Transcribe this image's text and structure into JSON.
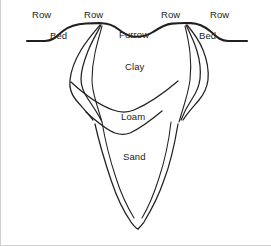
{
  "diagram": {
    "stroke_color": "#231f20",
    "background_color": "#ffffff",
    "border_color": "#cfcfcf",
    "labels": [
      {
        "id": "row-left-outer",
        "text": "Row",
        "x": 31,
        "y": 9
      },
      {
        "id": "row-left-inner",
        "text": "Row",
        "x": 83,
        "y": 9
      },
      {
        "id": "row-right-inner",
        "text": "Row",
        "x": 160,
        "y": 9
      },
      {
        "id": "row-right-outer",
        "text": "Row",
        "x": 209,
        "y": 9
      },
      {
        "id": "bed-left",
        "text": "Bed",
        "x": 49,
        "y": 30
      },
      {
        "id": "furrow",
        "text": "Furrow",
        "x": 118,
        "y": 29
      },
      {
        "id": "bed-right",
        "text": "Bed",
        "x": 198,
        "y": 30
      },
      {
        "id": "layer-clay",
        "text": "Clay",
        "x": 124,
        "y": 61
      },
      {
        "id": "layer-loam",
        "text": "Loam",
        "x": 120,
        "y": 111
      },
      {
        "id": "layer-sand",
        "text": "Sand",
        "x": 122,
        "y": 151
      }
    ],
    "paths": [
      {
        "id": "soil-surface",
        "role": "ground-surface-profile",
        "class": "soil-line",
        "d": "M 26,41 L 44,41 C 52,41 56,36 62,31 C 67,27 74,24 85,23.5 C 92,23.2 97,23.1 101,23.2 C 108,23.5 112,25 117,29 C 122,33 126,36 132,36.6 C 140,37.2 146,36 152,32 C 158,28 163,24.5 171,23.6 C 178,22.9 184,22.9 190,23.1 C 198,23.4 203,26 209,31 C 215,36 219,41 227,41 L 246,41"
      },
      {
        "id": "wetting-front-left-outer",
        "role": "wetting-front-boundary",
        "class": "front-line",
        "d": "M 99,25 C 93,32 86,40 80,50 C 74,60 70,70 69,80 C 68,88 70,94 75,100 C 80,106 86,112 92,120"
      },
      {
        "id": "wetting-front-left-mid",
        "role": "wetting-front-boundary",
        "class": "front-line",
        "d": "M 100,25 C 96,33 91,41 87,51 C 83,61 80,70 80,79 C 80,87 83,93 87,99 C 91,105 96,112 100,120"
      },
      {
        "id": "wetting-front-left-inner",
        "role": "wetting-front-boundary",
        "class": "front-line-thin",
        "d": "M 101,26 C 99,34 96,43 94,53 C 92,62 91,71 91,80 C 91,88 93,95 95,102 C 97,109 99,115 101,122"
      },
      {
        "id": "wetting-front-right-outer",
        "role": "wetting-front-boundary",
        "class": "front-line",
        "d": "M 186,25 C 192,32 198,40 202,50 C 206,60 208,70 207,80 C 206,88 203,94 198,100 C 193,106 187,112 182,120"
      },
      {
        "id": "wetting-front-right-mid",
        "role": "wetting-front-boundary",
        "class": "front-line",
        "d": "M 185,25 C 189,33 193,41 196,51 C 199,61 200,70 199,79 C 198,87 195,93 191,99 C 187,105 183,112 180,120"
      },
      {
        "id": "wetting-front-right-inner",
        "role": "wetting-front-boundary",
        "class": "front-line-thin",
        "d": "M 184,26 C 186,34 188,43 189,53 C 190,62 190,71 189,80 C 188,88 186,95 184,102 C 182,109 180,115 178,122"
      },
      {
        "id": "clay-loam-interface",
        "role": "layer-boundary-clay-loam",
        "class": "front-line",
        "d": "M 70,82 C 84,95 98,105 112,110 C 120,113 126,113 133,110 C 147,104 163,93 177,81"
      },
      {
        "id": "loam-sand-interface",
        "role": "layer-boundary-loam-sand",
        "class": "front-line",
        "d": "M 85,112 C 96,122 106,130 114,133 C 120,135 124,135 129,133 C 138,129 149,121 161,111"
      },
      {
        "id": "wetting-front-deep-left",
        "role": "deep-wetting-front",
        "class": "front-line",
        "d": "M 94,124 C 98,142 104,162 110,180 C 116,198 123,212 130,222 C 133,226 135,228 137,229"
      },
      {
        "id": "wetting-front-deep-right",
        "role": "deep-wetting-front",
        "class": "front-line",
        "d": "M 177,124 C 174,142 170,162 163,180 C 157,198 149,212 143,222 C 140,226 138,228 137,229"
      },
      {
        "id": "wetting-front-deep-left-inner",
        "role": "deep-wetting-front",
        "class": "front-line-thin",
        "d": "M 101,122 C 104,140 109,160 115,178 C 120,194 127,208 133,218"
      },
      {
        "id": "wetting-front-deep-right-inner",
        "role": "deep-wetting-front",
        "class": "front-line-thin",
        "d": "M 170,122 C 168,140 164,160 158,178 C 153,194 147,208 141,218"
      }
    ]
  }
}
